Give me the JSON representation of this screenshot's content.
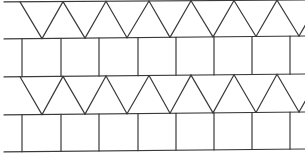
{
  "diagram": {
    "line_color": "#3a3a3a",
    "background": "#ffffff",
    "rows": [
      {
        "type": "triangles",
        "top_y": [
          2,
          0
        ],
        "bottom_y": [
          39,
          36
        ],
        "apex_top_x": [
          20,
          63,
          106,
          149,
          191,
          234,
          277
        ],
        "vertex_bottom_x": [
          42,
          85,
          127,
          170,
          213,
          256,
          299
        ]
      },
      {
        "type": "squares",
        "top_y": [
          39,
          36
        ],
        "bottom_y": [
          77,
          74
        ],
        "vertical_x": [
          22,
          61,
          99,
          138,
          176,
          214,
          252,
          290
        ]
      },
      {
        "type": "triangles",
        "top_y": [
          77,
          74
        ],
        "bottom_y": [
          115,
          112
        ],
        "apex_top_x": [
          20,
          63,
          106,
          149,
          191,
          234,
          277
        ],
        "vertex_bottom_x": [
          42,
          85,
          127,
          170,
          213,
          256,
          299
        ]
      },
      {
        "type": "squares",
        "top_y": [
          115,
          112
        ],
        "bottom_y": [
          152,
          149
        ],
        "vertical_x": [
          22,
          61,
          99,
          138,
          176,
          214,
          252,
          290
        ]
      }
    ]
  }
}
